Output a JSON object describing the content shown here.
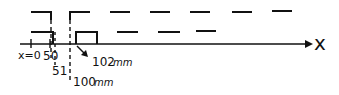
{
  "diagram": {
    "axis_label": "x",
    "origin_label": "x=0",
    "tick_labels": {
      "t50": "50",
      "t51": "51",
      "t100": "100",
      "t100_unit": "mm",
      "t102": "102",
      "t102_unit": "mm"
    },
    "colors": {
      "ink": "#111111",
      "background": "#ffffff"
    }
  }
}
